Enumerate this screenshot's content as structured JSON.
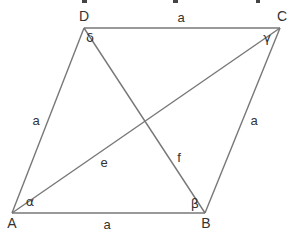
{
  "diagram": {
    "type": "rhombus",
    "line_color": "#777777",
    "text_color": "#333333",
    "top_cut_text": "",
    "vertices": [
      {
        "id": "A",
        "label": "A",
        "x": 12,
        "y": 213,
        "lx": 12,
        "ly": 228
      },
      {
        "id": "B",
        "label": "B",
        "x": 205,
        "y": 213,
        "lx": 206,
        "ly": 228
      },
      {
        "id": "C",
        "label": "C",
        "x": 280,
        "y": 28,
        "lx": 282,
        "ly": 21
      },
      {
        "id": "D",
        "label": "D",
        "x": 84,
        "y": 28,
        "lx": 84,
        "ly": 21
      }
    ],
    "sides": [
      {
        "from": "A",
        "to": "B",
        "label": "a",
        "lx": 107,
        "ly": 229
      },
      {
        "from": "B",
        "to": "C",
        "label": "a",
        "lx": 254,
        "ly": 125
      },
      {
        "from": "C",
        "to": "D",
        "label": "a",
        "lx": 181,
        "ly": 22
      },
      {
        "from": "D",
        "to": "A",
        "label": "a",
        "lx": 36,
        "ly": 125
      }
    ],
    "diagonals": [
      {
        "from": "A",
        "to": "C",
        "label": "e",
        "lx": 104,
        "ly": 167
      },
      {
        "from": "B",
        "to": "D",
        "label": "f",
        "lx": 179,
        "ly": 162
      }
    ],
    "angles": [
      {
        "vertex": "A",
        "symbol": "α",
        "lx": 30,
        "ly": 206
      },
      {
        "vertex": "B",
        "symbol": "β",
        "lx": 195,
        "ly": 208
      },
      {
        "vertex": "C",
        "symbol": "γ",
        "lx": 267,
        "ly": 42
      },
      {
        "vertex": "D",
        "symbol": "δ",
        "lx": 90,
        "ly": 42
      }
    ]
  }
}
